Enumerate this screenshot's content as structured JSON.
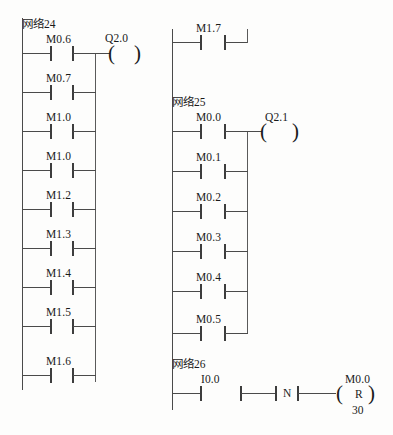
{
  "diagram": {
    "type": "ladder-logic",
    "language": "zh-CN",
    "line_color": "#4a4a4a",
    "text_color": "#1a1a1a",
    "background_color": "#fdfdfc"
  },
  "networks": [
    {
      "id": "network-24",
      "label": "网络24",
      "coil": {
        "label": "Q2.0",
        "kind": "output"
      },
      "contacts_left_column": [
        "M0.6",
        "M0.7",
        "M1.0",
        "M1.0",
        "M1.2",
        "M1.3",
        "M1.4",
        "M1.5",
        "M1.6"
      ],
      "contacts_right_column": [
        "M1.7"
      ]
    },
    {
      "id": "network-25",
      "label": "网络25",
      "coil": {
        "label": "Q2.1",
        "kind": "output"
      },
      "contacts": [
        "M0.0",
        "M0.1",
        "M0.2",
        "M0.3",
        "M0.4",
        "M0.5"
      ]
    },
    {
      "id": "network-26",
      "label": "网络26",
      "contacts": [
        "I0.0"
      ],
      "edge_block": {
        "letter": "N",
        "meaning": "negative-edge"
      },
      "coil": {
        "label": "M0.0",
        "kind": "reset",
        "operator": "R",
        "value": "30"
      }
    }
  ],
  "caption": {
    "text": ""
  }
}
